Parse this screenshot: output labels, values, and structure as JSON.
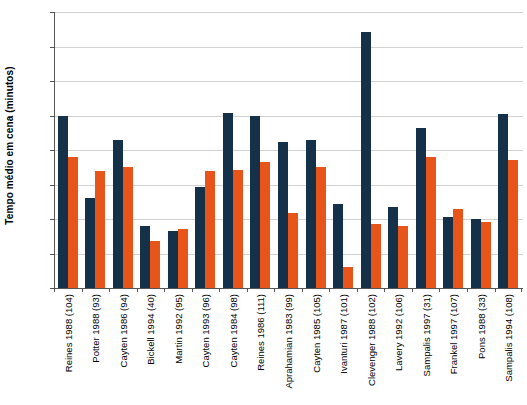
{
  "chart_data": {
    "type": "bar",
    "title": "",
    "xlabel": "",
    "ylabel": "Tempo médio em cena (minutos)",
    "ylim": [
      0,
      40
    ],
    "ytick_labels": [
      "40",
      "35",
      "30",
      "25",
      "20",
      "15",
      "10",
      "5",
      "0"
    ],
    "ytick_values": [
      40,
      35,
      30,
      25,
      20,
      15,
      10,
      5,
      0
    ],
    "grid": true,
    "legend": "none",
    "categories": [
      "Reines 1988 (104)",
      "Potter 1988 (93)",
      "Cayten 1986 (94)",
      "Bickell 1994 (40)",
      "Martin 1992 (95)",
      "Cayten 1993 (96)",
      "Cayten 1984 (98)",
      "Reines 1986 (111)",
      "Aprahamian 1983 (99)",
      "Cayten 1985 (105)",
      "Ivanturi 1987 (101)",
      "Clevenger 1988 (102)",
      "Lavery 1992 (106)",
      "Sampalis 1997 (31)",
      "Frankel 1997 (107)",
      "Pons 1988 (33)",
      "Sampalis 1994 (108)"
    ],
    "series": [
      {
        "name": "serie-1",
        "color": "#153049",
        "values": [
          25.0,
          13.1,
          21.4,
          9.0,
          8.3,
          14.6,
          25.4,
          25.0,
          21.1,
          21.5,
          12.2,
          37.1,
          11.7,
          23.2,
          10.3,
          10.0,
          25.2
        ]
      },
      {
        "name": "serie-2",
        "color": "#e8551b",
        "values": [
          19.0,
          17.0,
          17.5,
          6.8,
          8.5,
          17.0,
          17.1,
          18.2,
          10.9,
          17.5,
          3.0,
          9.3,
          9.0,
          19.0,
          11.5,
          9.6,
          18.6
        ]
      }
    ]
  },
  "colors": {
    "navy": "#153049",
    "orange": "#e8551b",
    "axis": "#555555",
    "grid": "#d2d2d2",
    "background": "#ffffff"
  }
}
